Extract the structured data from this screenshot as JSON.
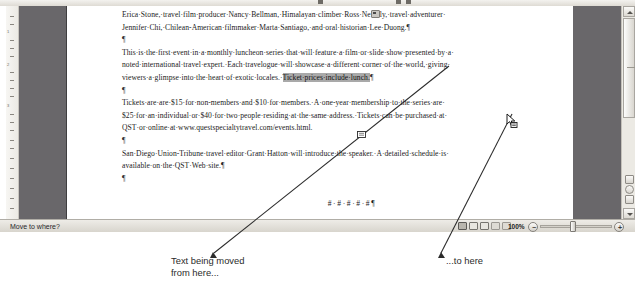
{
  "window": {
    "app": "word-document-window",
    "zoom_level": "100%"
  },
  "status_bar": {
    "message": "Move to where?",
    "zoom_label": "100%",
    "zoom_out_sign": "−",
    "zoom_in_sign": "+"
  },
  "document": {
    "paragraphs": [
      {
        "id": "p-presenters",
        "lines": [
          "Erica·Stone,·travel·film·producer·Nancy·Bellman,·Himalayan·climber·Ross·Ne",
          "ly,·travel·adventurer·",
          "Jennifer·Chi,·Chilean-American·filmmaker·Marta·Santiago,·and·oral·historian·Lee·Duong."
        ]
      },
      {
        "id": "p-blank-1",
        "text": "¶"
      },
      {
        "id": "p-series",
        "lines": [
          "This·is·the·first·event·in·a·monthly·luncheon·series·that·will·feature·a·film·or·slide·show·presented·by·a·",
          "noted·international·travel·expert.·Each·travelogue·will·showcase·a·different·corner·of·the·world,·giving·",
          "viewers·a·glimpse·into·the·heart·of·exotic·locales.·"
        ],
        "selected_text": "Ticket·prices·include·lunch.",
        "trailing": "¶"
      },
      {
        "id": "p-blank-2",
        "text": "¶"
      },
      {
        "id": "p-tickets",
        "lines": [
          "Tickets·are·are·$15·for·non-members·and·$10·for·members.·A·one-year·membership·to·the·series·are·",
          "$25·for·an·individual·or·$40·for·two·people·residing·at·the·same·address.·Tickets·can·be·purchased·at·",
          "QST·or·online·at·www.questspecialtytravel.com/events.html."
        ]
      },
      {
        "id": "p-blank-3",
        "text": "¶"
      },
      {
        "id": "p-editor",
        "lines": [
          "San·Diego·Union-Tribune·travel·editor·Grant·Hatton·will·introduce·the·speaker.·A·detailed·schedule·is·",
          "available·on·the·QST·Web·site.¶"
        ]
      },
      {
        "id": "p-blank-4",
        "text": "¶"
      },
      {
        "id": "p-hashes",
        "text": "#·#·#·#·#¶"
      }
    ]
  },
  "callouts": {
    "left": "Text being moved\nfrom here...",
    "left_line1": "Text being moved",
    "left_line2": "from here...",
    "right": "...to here"
  },
  "ruler": {
    "labels": [
      "1",
      "2",
      "3"
    ]
  },
  "colors": {
    "selection_highlight": "#a9a9a9",
    "page_background": "#ffffff",
    "workspace_gray": "#69676a",
    "chrome": "#dedbd4"
  }
}
